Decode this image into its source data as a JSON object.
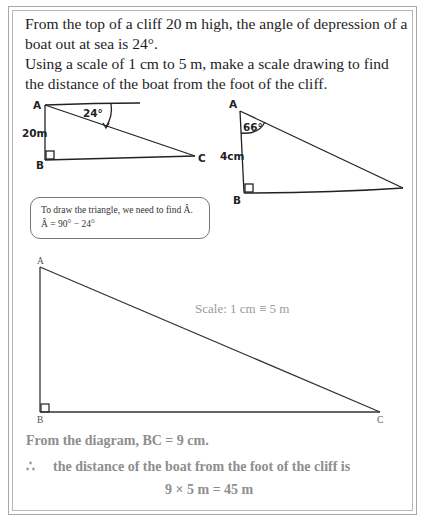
{
  "problem": {
    "line1": "From the top of a cliff 20 m high, the angle of depression of a boat out at sea is 24°.",
    "line2": "Using a scale of 1 cm to 5 m, make a scale drawing to find the distance of the boat from the foot of the cliff."
  },
  "sketch1": {
    "vertex_a": "A",
    "vertex_b": "B",
    "vertex_c": "C",
    "height_label": "20m",
    "angle_label": "24°"
  },
  "sketch2": {
    "vertex_a": "A",
    "vertex_b": "B",
    "height_label": "4cm",
    "angle_label": "66°"
  },
  "note": {
    "line1": "To draw the triangle, we need to find Â.",
    "line2": "Â = 90° − 24°"
  },
  "scale_drawing": {
    "vertex_a": "A",
    "vertex_b": "B",
    "vertex_c": "C",
    "scale_text": "Scale:  1 cm ≡ 5 m"
  },
  "solution": {
    "line1": "From the diagram,  BC = 9 cm.",
    "therefore_symbol": "∴",
    "line2": "the distance of the boat from the foot of the cliff is",
    "line3": "9 × 5 m = 45 m"
  },
  "colors": {
    "text_dark": "#1e1e1e",
    "text_solution": "#8e8e8e",
    "frame": "#a8a8a8"
  }
}
